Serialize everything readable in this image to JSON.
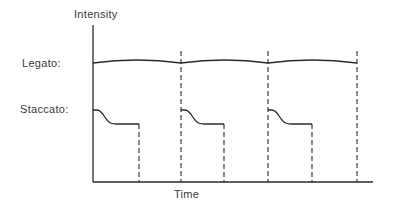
{
  "diagram": {
    "y_axis_label": "Intensity",
    "x_axis_label": "Time",
    "rows": [
      {
        "id": "legato",
        "label": "Legato:"
      },
      {
        "id": "staccato",
        "label": "Staccato:"
      }
    ],
    "note_count": 3,
    "colors": {
      "line": "#2a2a2a",
      "text": "#3a3a3a",
      "background": "#ffffff"
    }
  }
}
